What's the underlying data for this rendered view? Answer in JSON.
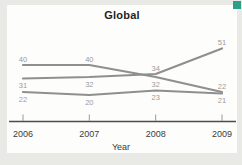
{
  "figure": {
    "corner_marker_color": "#2e9d8a"
  },
  "chart_data": {
    "type": "line",
    "title": "Global",
    "xlabel": "Year",
    "ylabel": "",
    "categories": [
      "2006",
      "2007",
      "2008",
      "2009"
    ],
    "series": [
      {
        "name": "declining-line",
        "values": [
          40,
          40,
          32,
          22
        ]
      },
      {
        "name": "rising-line",
        "values": [
          31,
          32,
          34,
          51
        ]
      },
      {
        "name": "flat-line",
        "values": [
          22,
          20,
          23,
          21
        ]
      }
    ],
    "point_labels_visible": true,
    "label_positions": [
      [
        "above",
        "above",
        "below",
        "above"
      ],
      [
        "below",
        "below",
        "above",
        "above"
      ],
      [
        "below",
        "below",
        "below",
        "below"
      ]
    ],
    "grid": false,
    "legend": "none",
    "y_axis_visible": false,
    "colors": {
      "line": "#8f8f8f",
      "point_label": "#9b9b9b",
      "axis": "#4d4d4d",
      "tick": "#9b9b9b",
      "tick_label": "#3b3b3b",
      "axis_title": "#3b3b3b"
    }
  }
}
